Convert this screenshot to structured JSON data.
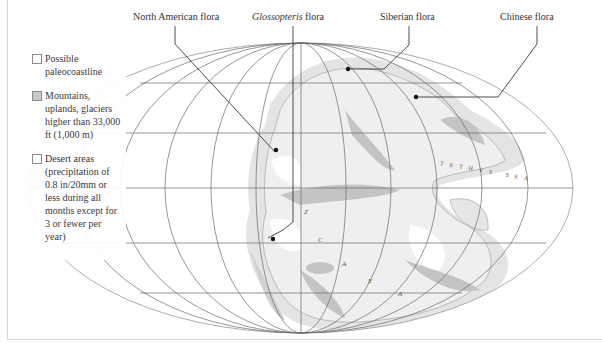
{
  "figure": {
    "type": "paleogeographic-world-map",
    "projection": "Mollweide-style elliptical"
  },
  "callouts": [
    {
      "id": "north-american",
      "label": "North American flora",
      "italic_part": ""
    },
    {
      "id": "glossopteris",
      "italic_part": "Glossopteris",
      "label_suffix": " flora"
    },
    {
      "id": "siberian",
      "label": "Siberian flora"
    },
    {
      "id": "chinese",
      "label": "Chinese flora"
    }
  ],
  "legend": {
    "items": [
      {
        "label": "Possible paleocoastline",
        "swatch_color": "#ffffff"
      },
      {
        "label": "Mountains, uplands, glaciers higher than 33,000 ft (1,000 m)",
        "swatch_color": "#c8c8c8"
      },
      {
        "label": "Desert areas (precipitation of 0.8 in/20mm or less during all months except for 3 or fewer per year)",
        "swatch_color": "#ffffff"
      }
    ]
  },
  "map_labels": {
    "sea": "TETHYS SEA",
    "letters": [
      "Z",
      "C",
      "A",
      "E",
      "A"
    ]
  },
  "colors": {
    "land": "#ececec",
    "coast_band": "#dcdcdc",
    "mountains": "#bdbdbd",
    "desert": "#ffffff",
    "graticule": "#6a6a6a",
    "leader_line": "#222222"
  }
}
